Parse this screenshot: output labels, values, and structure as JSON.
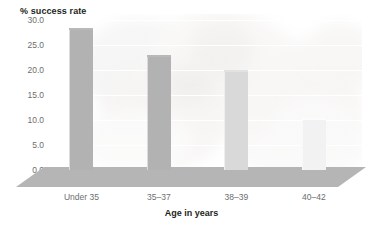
{
  "chart_data": {
    "type": "bar",
    "title": "% success rate",
    "xlabel": "Age in years",
    "ylabel": "% success rate",
    "categories": [
      "Under 35",
      "35–37",
      "38–39",
      "40–42"
    ],
    "values": [
      28.5,
      23.0,
      20.0,
      10.5
    ],
    "ylim": [
      0.0,
      30.0
    ],
    "ytick_labels": [
      "30.0",
      "25.0",
      "20.0",
      "15.0",
      "10.0",
      "5.0",
      "0.0"
    ],
    "ytick_values": [
      30.0,
      25.0,
      20.0,
      15.0,
      10.0,
      5.0,
      0.0
    ],
    "grid": true,
    "legend": null,
    "bar_colors": [
      "#b2b2b2",
      "#b2b2b2",
      "#d9d9d9",
      "#f2f2f2"
    ],
    "gridline_color": "#ffffff",
    "floor_color": "#b5b5b5",
    "tick_label_color": "#6d6e71",
    "axis_title_color": "#231f20",
    "background": "#ffffff"
  },
  "axes": {
    "y_title": "% success rate",
    "x_title": "Age in years"
  }
}
